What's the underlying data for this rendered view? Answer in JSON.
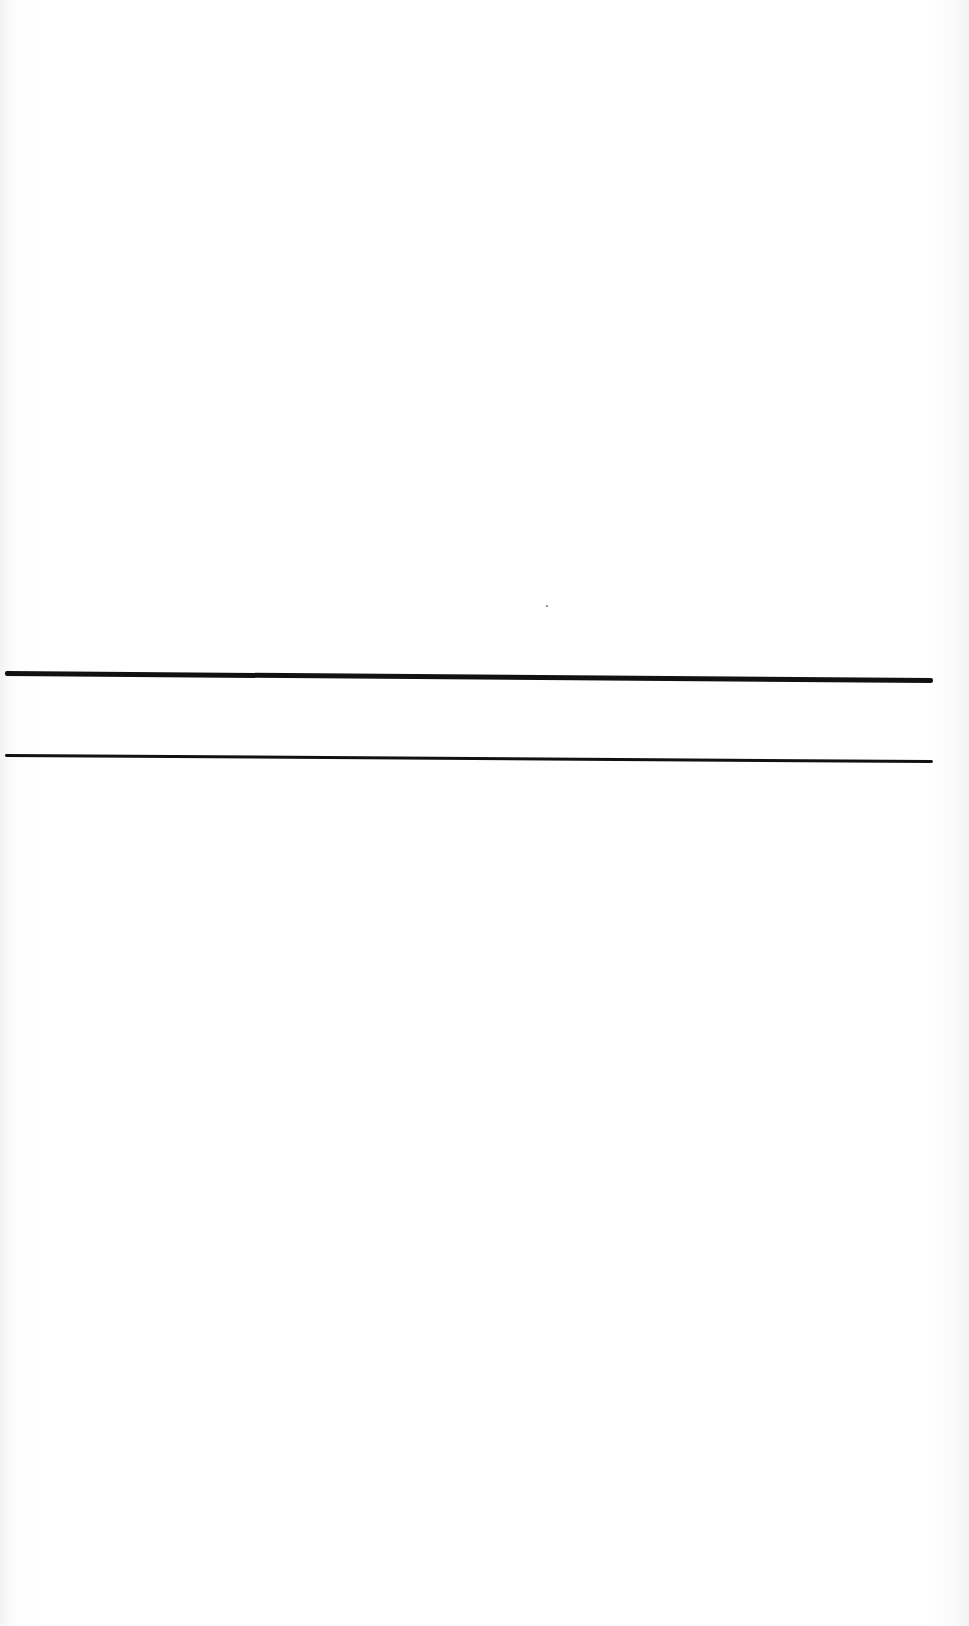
{
  "document": {
    "type": "blank scanned page",
    "background_color": "#ffffff",
    "rules": [
      {
        "name": "upper-rule",
        "style": "thick",
        "color": "#111111",
        "y_left": 673,
        "y_right": 680,
        "x_start": 5,
        "x_end": 931
      },
      {
        "name": "lower-rule",
        "style": "thin",
        "color": "#111111",
        "y_left": 755,
        "y_right": 761,
        "x_start": 5,
        "x_end": 931
      }
    ],
    "text": ""
  }
}
